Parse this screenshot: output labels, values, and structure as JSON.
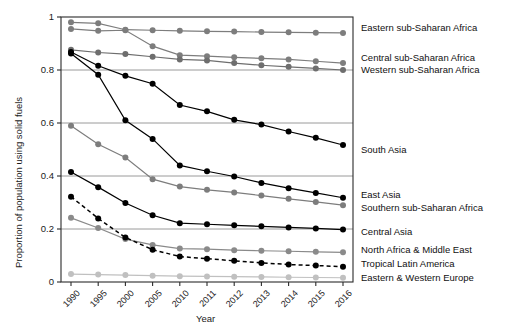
{
  "chart_data": {
    "type": "line",
    "title": "",
    "xlabel": "Year",
    "ylabel": "Proportion of population using solid fuels",
    "categories": [
      "1990",
      "1995",
      "2000",
      "2005",
      "2010",
      "2011",
      "2012",
      "2013",
      "2014",
      "2015",
      "2016"
    ],
    "ylim": [
      0,
      1
    ],
    "yticks": [
      "0",
      "0.2",
      "0.4",
      "0.6",
      "0.8",
      "1"
    ],
    "ytick_values": [
      0,
      0.2,
      0.4,
      0.6,
      0.8,
      1
    ],
    "grid": "horizontal",
    "legend": "right-of-axis labels at series endpoints",
    "series": [
      {
        "name": "Eastern sub-Saharan Africa",
        "color": "#7d7d7d",
        "dash": "solid",
        "values": [
          0.98,
          0.976,
          0.952,
          0.95,
          0.948,
          0.946,
          0.945,
          0.943,
          0.942,
          0.941,
          0.94
        ]
      },
      {
        "name": "Central sub-Saharan Africa",
        "color": "#7d7d7d",
        "dash": "solid",
        "values": [
          0.955,
          0.948,
          0.95,
          0.89,
          0.856,
          0.852,
          0.848,
          0.844,
          0.84,
          0.833,
          0.826
        ]
      },
      {
        "name": "Western sub-Saharan Africa",
        "color": "#6e6e6e",
        "dash": "solid",
        "values": [
          0.876,
          0.866,
          0.86,
          0.85,
          0.84,
          0.836,
          0.826,
          0.818,
          0.812,
          0.806,
          0.8
        ]
      },
      {
        "name": "South Asia",
        "color": "#000000",
        "dash": "solid",
        "values": [
          0.868,
          0.816,
          0.778,
          0.748,
          0.668,
          0.644,
          0.612,
          0.594,
          0.568,
          0.544,
          0.517
        ]
      },
      {
        "name": "East Asia",
        "color": "#000000",
        "dash": "solid",
        "values": [
          0.862,
          0.782,
          0.61,
          0.54,
          0.44,
          0.418,
          0.398,
          0.374,
          0.354,
          0.336,
          0.318
        ]
      },
      {
        "name": "Southern sub-Saharan Africa",
        "color": "#7d7d7d",
        "dash": "solid",
        "values": [
          0.59,
          0.52,
          0.47,
          0.388,
          0.36,
          0.348,
          0.338,
          0.326,
          0.314,
          0.302,
          0.29
        ]
      },
      {
        "name": "Central Asia",
        "color": "#000000",
        "dash": "solid",
        "values": [
          0.415,
          0.358,
          0.298,
          0.252,
          0.222,
          0.218,
          0.214,
          0.21,
          0.206,
          0.202,
          0.198
        ]
      },
      {
        "name": "North Africa & Middle East",
        "color": "#8a8a8a",
        "dash": "solid",
        "values": [
          0.242,
          0.204,
          0.162,
          0.14,
          0.126,
          0.124,
          0.12,
          0.118,
          0.116,
          0.114,
          0.112
        ]
      },
      {
        "name": "Tropical Latin America",
        "color": "#000000",
        "dash": "dashed",
        "values": [
          0.322,
          0.24,
          0.168,
          0.122,
          0.096,
          0.088,
          0.08,
          0.072,
          0.066,
          0.062,
          0.058
        ]
      },
      {
        "name": "Eastern & Western Europe",
        "color": "#c0c0c0",
        "dash": "solid",
        "values": [
          0.03,
          0.028,
          0.026,
          0.024,
          0.022,
          0.021,
          0.02,
          0.019,
          0.018,
          0.017,
          0.016
        ]
      }
    ],
    "series_labels": [
      {
        "name": "Eastern sub-Saharan Africa",
        "y": 28
      },
      {
        "name": "Central sub-Saharan Africa",
        "y": 58
      },
      {
        "name": "Western sub-Saharan Africa",
        "y": 70
      },
      {
        "name": "South Asia",
        "y": 150
      },
      {
        "name": "East Asia",
        "y": 195
      },
      {
        "name": "Southern sub-Saharan Africa",
        "y": 208
      },
      {
        "name": "Central Asia",
        "y": 232
      },
      {
        "name": "North Africa & Middle East",
        "y": 250
      },
      {
        "name": "Tropical Latin America",
        "y": 264
      },
      {
        "name": "Eastern & Western Europe",
        "y": 278
      }
    ]
  }
}
